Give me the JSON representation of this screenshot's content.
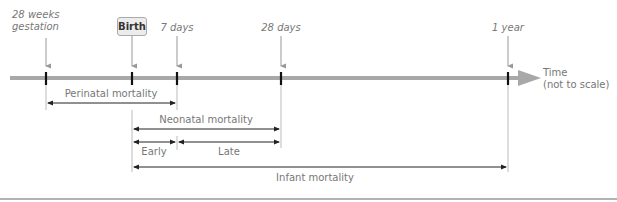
{
  "diagram": {
    "timeline": {
      "axis_label_line1": "Time",
      "axis_label_line2": "(not to scale)",
      "axis_color": "#a8a8a8"
    },
    "markers": [
      {
        "id": "gestation",
        "label_line1": "28 weeks",
        "label_line2": "gestation",
        "x": 46
      },
      {
        "id": "birth",
        "label": "Birth",
        "x": 132
      },
      {
        "id": "7days",
        "label": "7 days",
        "x": 177
      },
      {
        "id": "28days",
        "label": "28 days",
        "x": 281
      },
      {
        "id": "1year",
        "label": "1 year",
        "x": 508
      }
    ],
    "periods": [
      {
        "id": "perinatal",
        "label": "Perinatal mortality",
        "from": "28 weeks gestation",
        "to": "7 days"
      },
      {
        "id": "neonatal",
        "label": "Neonatal mortality",
        "from": "Birth",
        "to": "28 days"
      },
      {
        "id": "early",
        "label": "Early",
        "from": "Birth",
        "to": "7 days"
      },
      {
        "id": "late",
        "label": "Late",
        "from": "7 days",
        "to": "28 days"
      },
      {
        "id": "infant",
        "label": "Infant mortality",
        "from": "Birth",
        "to": "1 year"
      }
    ]
  }
}
